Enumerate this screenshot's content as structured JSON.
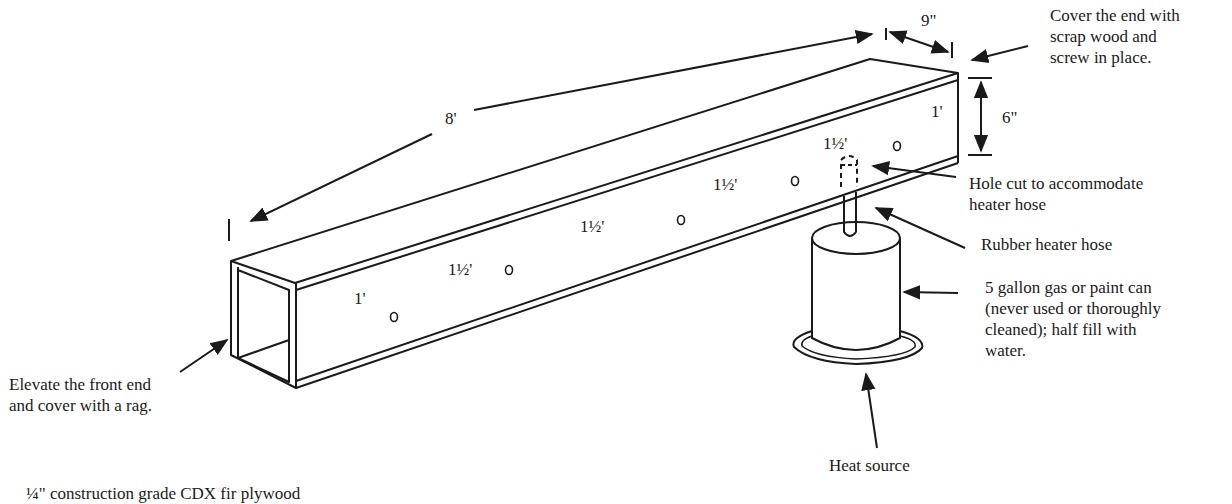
{
  "diagram": {
    "dimensions": {
      "length": "8'",
      "width": "9\"",
      "height": "6\""
    },
    "hole_spacings": [
      "1'",
      "1½'",
      "1½'",
      "1½'",
      "1½'",
      "1'"
    ],
    "callouts": {
      "cover_end": "Cover the end with scrap wood and screw in place.",
      "cover_end_lines": [
        "Cover the end with",
        "scrap wood and",
        "screw in place."
      ],
      "hole_cut_lines": [
        "Hole cut to accommodate",
        "heater hose"
      ],
      "rubber_hose": "Rubber heater hose",
      "gas_can_lines": [
        "5 gallon gas or paint can",
        "(never used or thoroughly",
        "cleaned); half fill with",
        "water."
      ],
      "heat_source": "Heat source",
      "elevate_lines": [
        "Elevate the front end",
        "and cover with a rag."
      ]
    },
    "material_note": "¼\" construction grade CDX  fir plywood"
  }
}
